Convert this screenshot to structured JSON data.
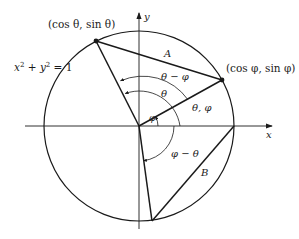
{
  "diagram": {
    "circle_label": "x² + y² = 1",
    "circle_label_parts": {
      "x": "x",
      "y": "y",
      "sup": "2",
      "plus": " + ",
      "eq": " = 1"
    },
    "axes": {
      "x_label": "x",
      "y_label": "y"
    },
    "points": {
      "theta_point": "(cos θ, sin θ)",
      "phi_point": "(cos φ, sin φ)"
    },
    "chords": {
      "A": "A",
      "B": "B"
    },
    "angles": {
      "theta_minus_phi": "θ − φ",
      "theta": "θ",
      "theta_phi": "θ, φ",
      "phi": "φ",
      "phi_minus_theta": "φ − θ"
    },
    "colors": {
      "stroke": "#1a1a1a",
      "background": "#ffffff"
    }
  }
}
